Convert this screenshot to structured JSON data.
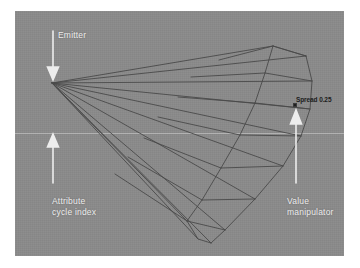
{
  "app": {
    "title": "Particle Emitter Spread Manipulator",
    "viewport_background": "#8b8b8b",
    "wireframe_color": "#4a4a4a",
    "annotation_color": "#ededed",
    "readout_color": "#1c1c1c"
  },
  "viewport": {
    "name": "3d-viewport",
    "grid_line_visible": true
  },
  "annotations": [
    {
      "id": "emitter",
      "label": "Emitter",
      "arrow_direction": "down",
      "points_to": "emitter-origin"
    },
    {
      "id": "attribute-cycle-index",
      "label": "Attribute\ncycle index",
      "arrow_direction": "up",
      "points_to": "attribute-cycle-index-marker"
    },
    {
      "id": "value-manipulator",
      "label": "Value\nmanipulator",
      "arrow_direction": "up",
      "points_to": "manipulator-handle"
    }
  ],
  "readout": {
    "attribute_name": "Spread",
    "attribute_value": "0.25",
    "text": "Spread 0.25"
  },
  "icons": {
    "arrow_down": "arrow-down-icon",
    "arrow_up": "arrow-up-icon",
    "handle": "manipulator-handle-icon"
  }
}
